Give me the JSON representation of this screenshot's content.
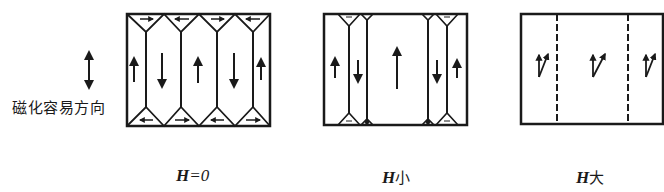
{
  "easy_axis": {
    "label": "磁化容易方向",
    "arrow_icon": "double-vertical-arrow"
  },
  "panels": [
    {
      "id": "h-zero",
      "caption_symbol": "H",
      "caption_rest": "=0",
      "description": "Field H = 0: alternating up/down main domains with triangular closure domains at top and bottom",
      "domain_arrows": [
        "up",
        "down",
        "up",
        "down",
        "up"
      ],
      "closure_top_arrows": [
        "right",
        "left",
        "right",
        "left"
      ],
      "closure_bottom_arrows": [
        "left",
        "right",
        "left",
        "right"
      ]
    },
    {
      "id": "h-small",
      "caption_symbol": "H",
      "caption_rest": "小",
      "description": "Small field: up-magnetized central domain grows, down domains shrink, closure domains shrink",
      "domain_arrows": [
        "up",
        "down",
        "up",
        "down",
        "up"
      ]
    },
    {
      "id": "h-large",
      "caption_symbol": "H",
      "caption_rest": "大",
      "description": "Large field: magnetization rotates toward field direction, walls become dashed",
      "domain_arrows": [
        "rotated",
        "rotated",
        "rotated"
      ]
    }
  ],
  "colors": {
    "ink": "#1a1a1a",
    "background": "#ffffff"
  }
}
